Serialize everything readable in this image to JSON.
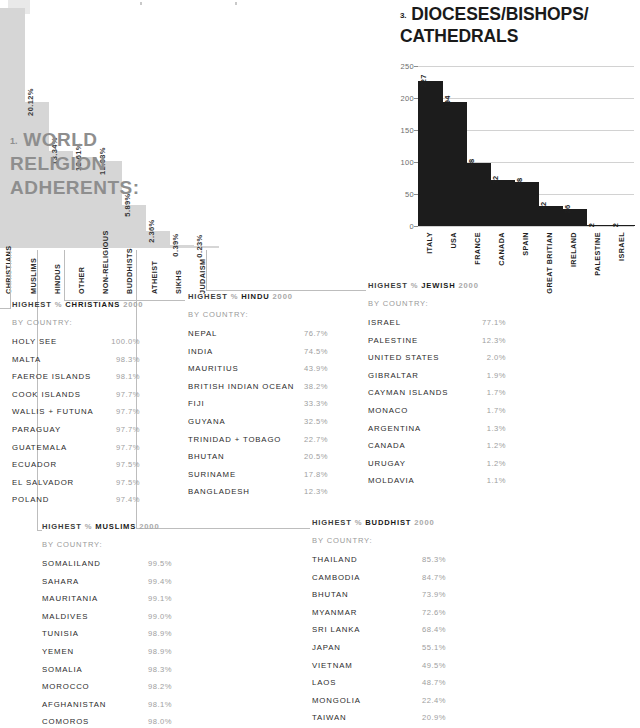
{
  "step_chart": {
    "number": "1.",
    "title": "WORLD RELIGION ADHERENTS:",
    "title_line1": "WORLD",
    "title_line2": "RELIGION",
    "title_line3": "ADHERENTS:"
  },
  "bar_chart": {
    "number": "3.",
    "title_line1": "DIOCESES/BISHOPS/",
    "title_line2": "CATHEDRALS"
  },
  "chart_data": [
    {
      "type": "bar",
      "id": "world-religion-adherents",
      "title": "WORLD RELIGION ADHERENTS:",
      "xlabel": "",
      "ylabel": "",
      "unit": "%",
      "grid": false,
      "legend": "none",
      "ylim": [
        0,
        33.12
      ],
      "categories": [
        "CHRISTIANS",
        "MUSLIMS",
        "HINDUS",
        "OTHER",
        "NON-RELIGIOUS",
        "BUDDHISTS",
        "ATHEIST",
        "SIKHS",
        "JUDAISM"
      ],
      "values": [
        33.12,
        20.12,
        13.34,
        12.61,
        12.03,
        5.89,
        2.36,
        0.39,
        0.23
      ],
      "value_labels": [
        "",
        "20.12%",
        "13.34%",
        "12.61%",
        "12.03%",
        "5.89%",
        "2.36%",
        "0.39%",
        "0.23%"
      ]
    },
    {
      "type": "bar",
      "id": "dioceses-bishops-cathedrals",
      "title": "DIOCESES/BISHOPS/CATHEDRALS",
      "xlabel": "",
      "ylabel": "",
      "grid": true,
      "legend": "none",
      "ylim": [
        0,
        250
      ],
      "yticks": [
        0,
        50,
        100,
        150,
        200,
        250
      ],
      "categories": [
        "ITALY",
        "USA",
        "FRANCE",
        "CANADA",
        "SPAIN",
        "GREAT BRITIAN",
        "IRELAND",
        "PALESTINE",
        "ISRAEL"
      ],
      "values": [
        227,
        194,
        98,
        72,
        68,
        32,
        26,
        2,
        2
      ],
      "value_labels": [
        "227",
        "194",
        "98",
        "72",
        "68",
        "32",
        "26",
        "2",
        "2"
      ]
    }
  ],
  "tables": [
    {
      "id": "christians",
      "head_prefix": "HIGHEST",
      "head_pct": "%",
      "head_faith": "CHRISTIANS",
      "head_year": "2000",
      "subhead": "BY COUNTRY:",
      "rows": [
        {
          "name": "HOLY SEE",
          "value": "100.0%"
        },
        {
          "name": "MALTA",
          "value": "98.3%"
        },
        {
          "name": "FAEROE ISLANDS",
          "value": "98.1%"
        },
        {
          "name": "COOK ISLANDS",
          "value": "97.7%"
        },
        {
          "name": "WALLIS + FUTUNA",
          "value": "97.7%"
        },
        {
          "name": "PARAGUAY",
          "value": "97.7%"
        },
        {
          "name": "GUATEMALA",
          "value": "97.7%"
        },
        {
          "name": "ECUADOR",
          "value": "97.5%"
        },
        {
          "name": "EL SALVADOR",
          "value": "97.5%"
        },
        {
          "name": "POLAND",
          "value": "97.4%"
        }
      ]
    },
    {
      "id": "hindu",
      "head_prefix": "HIGHEST",
      "head_pct": "%",
      "head_faith": "HINDU",
      "head_year": "2000",
      "subhead": "BY COUNTRY:",
      "rows": [
        {
          "name": "NEPAL",
          "value": "76.7%"
        },
        {
          "name": "INDIA",
          "value": "74.5%"
        },
        {
          "name": "MAURITIUS",
          "value": "43.9%"
        },
        {
          "name": "BRITISH INDIAN OCEAN",
          "value": "38.2%"
        },
        {
          "name": "FIJI",
          "value": "33.3%"
        },
        {
          "name": "GUYANA",
          "value": "32.5%"
        },
        {
          "name": "TRINIDAD + TOBAGO",
          "value": "22.7%"
        },
        {
          "name": "BHUTAN",
          "value": "20.5%"
        },
        {
          "name": "SURINAME",
          "value": "17.8%"
        },
        {
          "name": "BANGLADESH",
          "value": "12.3%"
        }
      ]
    },
    {
      "id": "jewish",
      "head_prefix": "HIGHEST",
      "head_pct": "%",
      "head_faith": "JEWISH",
      "head_year": "2000",
      "subhead": "BY COUNTRY:",
      "rows": [
        {
          "name": "ISRAEL",
          "value": "77.1%"
        },
        {
          "name": "PALESTINE",
          "value": "12.3%"
        },
        {
          "name": "UNITED STATES",
          "value": "2.0%"
        },
        {
          "name": "GIBRALTAR",
          "value": "1.9%"
        },
        {
          "name": "CAYMAN ISLANDS",
          "value": "1.7%"
        },
        {
          "name": "MONACO",
          "value": "1.7%"
        },
        {
          "name": "ARGENTINA",
          "value": "1.3%"
        },
        {
          "name": "CANADA",
          "value": "1.2%"
        },
        {
          "name": "URUGAY",
          "value": "1.2%"
        },
        {
          "name": "MOLDAVIA",
          "value": "1.1%"
        }
      ]
    },
    {
      "id": "muslims",
      "head_prefix": "HIGHEST",
      "head_pct": "%",
      "head_faith": "MUSLIMS",
      "head_year": "2000",
      "subhead": "BY COUNTRY:",
      "rows": [
        {
          "name": "SOMALILAND",
          "value": "99.5%"
        },
        {
          "name": "SAHARA",
          "value": "99.4%"
        },
        {
          "name": "MAURITANIA",
          "value": "99.1%"
        },
        {
          "name": "MALDIVES",
          "value": "99.0%"
        },
        {
          "name": "TUNISIA",
          "value": "98.9%"
        },
        {
          "name": "YEMEN",
          "value": "98.9%"
        },
        {
          "name": "SOMALIA",
          "value": "98.3%"
        },
        {
          "name": "MOROCCO",
          "value": "98.2%"
        },
        {
          "name": "AFGHANISTAN",
          "value": "98.1%"
        },
        {
          "name": "COMOROS",
          "value": "98.0%"
        }
      ]
    },
    {
      "id": "buddhist",
      "head_prefix": "HIGHEST",
      "head_pct": "%",
      "head_faith": "BUDDHIST",
      "head_year": "2000",
      "subhead": "BY COUNTRY:",
      "rows": [
        {
          "name": "THAILAND",
          "value": "85.3%"
        },
        {
          "name": "CAMBODIA",
          "value": "84.7%"
        },
        {
          "name": "BHUTAN",
          "value": "73.9%"
        },
        {
          "name": "MYANMAR",
          "value": "72.6%"
        },
        {
          "name": "SRI LANKA",
          "value": "68.4%"
        },
        {
          "name": "JAPAN",
          "value": "55.1%"
        },
        {
          "name": "VIETNAM",
          "value": "49.5%"
        },
        {
          "name": "LAOS",
          "value": "48.7%"
        },
        {
          "name": "MONGOLIA",
          "value": "22.4%"
        },
        {
          "name": "TAIWAN",
          "value": "20.9%"
        }
      ]
    }
  ],
  "colors": {
    "step_fill": "#d6d6d6",
    "step_title": "#8e8e8e",
    "bar_fill": "#1c1c1c",
    "grid": "#d2d2d2",
    "value_text": "#9e9e9e",
    "name_text": "#2b2b2b",
    "background": "#ffffff"
  }
}
